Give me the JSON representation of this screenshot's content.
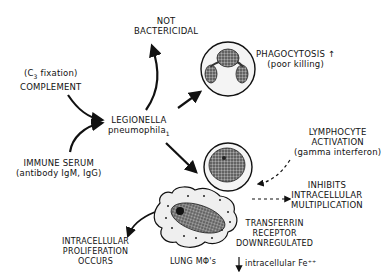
{
  "diagram": {
    "center": {
      "line1": "LEGIONELLA",
      "line2": "pneumophila",
      "subscript": "1"
    },
    "not_bactericidal": {
      "line1": "NOT",
      "line2": "BACTERICIDAL"
    },
    "complement": {
      "line1_pre": "(C",
      "line1_sub": "3",
      "line1_post": " fixation)",
      "line2": "COMPLEMENT"
    },
    "immune_serum": {
      "line1": "IMMUNE SERUM",
      "line2": "(antibody IgM, IgG)"
    },
    "phagocytosis": {
      "line1": "PHAGOCYTOSIS ↑",
      "line2": "(poor killing)"
    },
    "lymphocyte": {
      "line1": "LYMPHOCYTE",
      "line2": "ACTIVATION",
      "line3": "(gamma interferon)"
    },
    "inhibits": {
      "line1": "INHIBITS",
      "line2": "INTRACELLULAR",
      "line3": "MULTIPLICATION"
    },
    "transferrin": {
      "line1": "TRANSFERRIN",
      "line2": "RECEPTOR",
      "line3": "DOWNREGULATED"
    },
    "iron": {
      "arrow": "↓",
      "label": "intracellular Fe⁺⁺"
    },
    "proliferation": {
      "line1": "INTRACELLULAR",
      "line2": "PROLIFERATION",
      "line3": "OCCURS"
    },
    "macrophage": {
      "label": "LUNG MΦ's"
    }
  }
}
